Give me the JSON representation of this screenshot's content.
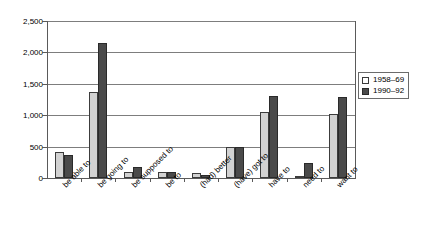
{
  "chart_data": {
    "type": "bar",
    "title": "",
    "subtitle": "",
    "xlabel": "",
    "ylabel": "",
    "ylim": [
      0,
      2500
    ],
    "ytick_labels": [
      "2,500",
      "2,000",
      "1,500",
      "1,000",
      "500",
      "0"
    ],
    "ytick_values": [
      2500,
      2000,
      1500,
      1000,
      500,
      0
    ],
    "grid": "horizontal",
    "legend_position": "right",
    "categories": [
      "be able to",
      "be going to",
      "be supposed to",
      "be to",
      "(had) better",
      "(have) got to",
      "have to",
      "need to",
      "want to"
    ],
    "series": [
      {
        "name": "1958–69",
        "color": "#d2d2d2",
        "values": [
          415,
          1370,
          90,
          95,
          85,
          500,
          1050,
          40,
          1020
        ]
      },
      {
        "name": "1990–92",
        "color": "#4a4a4a",
        "values": [
          370,
          2150,
          175,
          100,
          55,
          500,
          1300,
          240,
          1290
        ]
      }
    ]
  }
}
